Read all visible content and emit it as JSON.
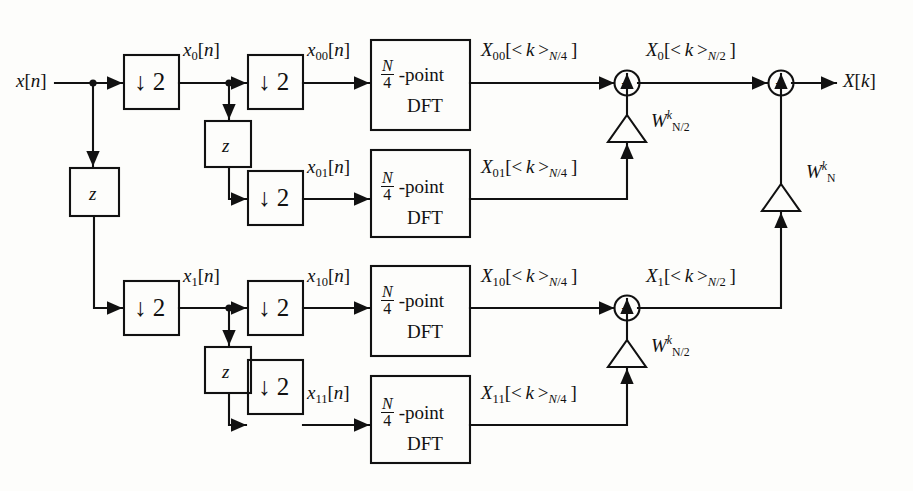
{
  "diagram": {
    "title_semantic": "radix-2 decimation-in-time FFT signal flow graph",
    "input": {
      "label_x": "x",
      "label_sub": "n"
    },
    "output": {
      "label_x": "X",
      "label_sub": "k"
    },
    "glyphs": {
      "downsample": "↓ 2",
      "delay": "z",
      "adder": "+",
      "open_bracket": "[",
      "close_bracket": "]",
      "mod_open": "<",
      "mod_close": ">"
    },
    "blocks": {
      "downsamplers": [
        {
          "name": "downsample-stage1-top",
          "label": "↓ 2"
        },
        {
          "name": "downsample-stage1-bottom",
          "label": "↓ 2"
        },
        {
          "name": "downsample-stage2-00",
          "label": "↓ 2"
        },
        {
          "name": "downsample-stage2-01",
          "label": "↓ 2"
        },
        {
          "name": "downsample-stage2-10",
          "label": "↓ 2"
        },
        {
          "name": "downsample-stage2-11",
          "label": "↓ 2"
        }
      ],
      "delays": [
        {
          "name": "delay-stage1",
          "label": "z"
        },
        {
          "name": "delay-stage2-top",
          "label": "z"
        },
        {
          "name": "delay-stage2-bottom",
          "label": "z"
        }
      ],
      "dfts": [
        {
          "name": "dft-00",
          "numerator": "N",
          "denominator": "4",
          "point_text": "-point",
          "dft_text": "DFT"
        },
        {
          "name": "dft-01",
          "numerator": "N",
          "denominator": "4",
          "point_text": "-point",
          "dft_text": "DFT"
        },
        {
          "name": "dft-10",
          "numerator": "N",
          "denominator": "4",
          "point_text": "-point",
          "dft_text": "DFT"
        },
        {
          "name": "dft-11",
          "numerator": "N",
          "denominator": "4",
          "point_text": "-point",
          "dft_text": "DFT"
        }
      ]
    },
    "signals": {
      "input": "x[n]",
      "x0": "x0[n]",
      "x1": "x1[n]",
      "x00": "x00[n]",
      "x01": "x01[n]",
      "x10": "x10[n]",
      "x11": "x11[n]",
      "X00": "X00[<k>N/4]",
      "X01": "X01[<k>N/4]",
      "X10": "X10[<k>N/4]",
      "X11": "X11[<k>N/4]",
      "X0": "X0[<k>N/2]",
      "X1": "X1[<k>N/2]",
      "output": "X[k]"
    },
    "twiddles": [
      {
        "name": "twiddle-top",
        "base": "W",
        "sub": "N/2",
        "sup": "k"
      },
      {
        "name": "twiddle-bottom",
        "base": "W",
        "sub": "N/2",
        "sup": "k"
      },
      {
        "name": "twiddle-final",
        "base": "W",
        "sub": "N",
        "sup": "k"
      }
    ],
    "adders": [
      {
        "name": "adder-X0",
        "label": "+"
      },
      {
        "name": "adder-X1",
        "label": "+"
      },
      {
        "name": "adder-output",
        "label": "+"
      }
    ],
    "colors": {
      "line": "#111111",
      "background": "#fdfdfb",
      "text": "#111111"
    }
  }
}
